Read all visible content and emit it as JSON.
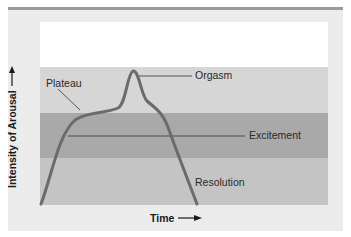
{
  "diagram": {
    "y_axis_label": "Intensity of Arousal",
    "x_axis_label": "Time",
    "arrow_icon": "right-arrow-icon",
    "phases": [
      {
        "label": "Plateau"
      },
      {
        "label": "Orgasm"
      },
      {
        "label": "Excitement"
      },
      {
        "label": "Resolution"
      }
    ],
    "colors": {
      "panel": "#ececec",
      "top_rule": "#9a9a9a",
      "band_top": "#ffffff",
      "band_plateau": "#d6d6d6",
      "band_excitement": "#a9a9a9",
      "band_resolution": "#c4c4c4",
      "curve": "#6b6b6b"
    }
  }
}
